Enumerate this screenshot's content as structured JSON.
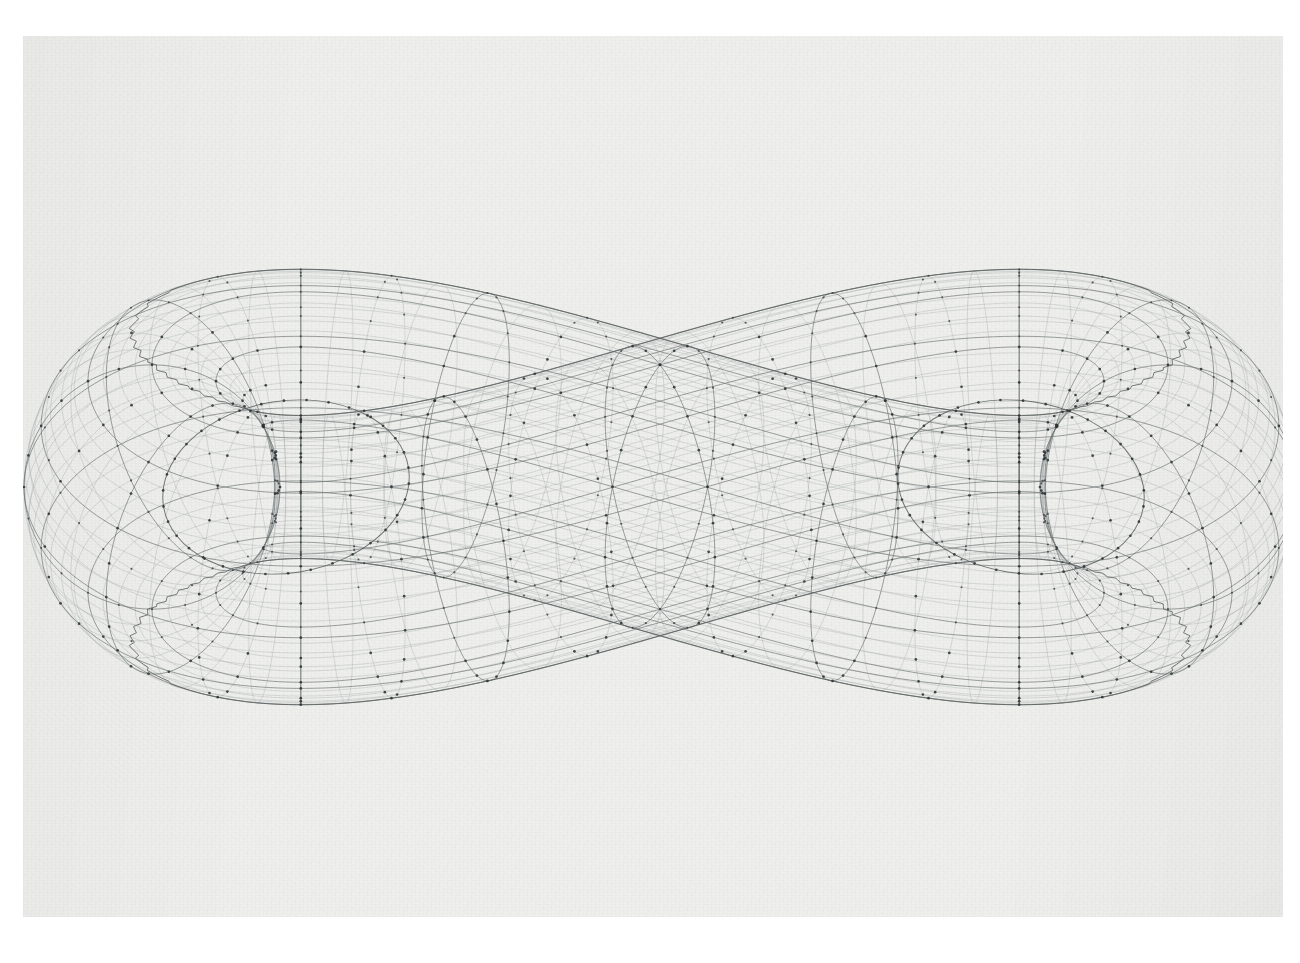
{
  "document": {
    "kind": "scanned-figure-page",
    "background_color": "#ffffff",
    "paper_color": "#eff0ee",
    "page_rect": {
      "x": 23,
      "y": 36,
      "width": 1260,
      "height": 881
    }
  },
  "figure": {
    "title": "",
    "caption": "",
    "ink_color": "#5d6262",
    "fine_line_color": "#9aa0a0",
    "rib_line_color": "#6e7474",
    "node_color": "#3d4242",
    "projection": "orthographic",
    "has_axes": false,
    "has_axis_labels": false,
    "has_legend": false,
    "has_tick_labels": false,
    "has_title_text": false
  },
  "chart_data": {
    "type": "line",
    "title": "",
    "subtitle": "",
    "xlabel": "",
    "ylabel": "",
    "legend": [],
    "annotations": [],
    "grid": true,
    "surface": {
      "name": "genus-2 double torus wireframe",
      "topology": "genus-2",
      "lobes": 2,
      "u_parameter": {
        "name": "ring angle",
        "range_deg": [
          0,
          360
        ],
        "major_divisions": 16,
        "fine_divisions": 64
      },
      "v_parameter": {
        "name": "tube angle",
        "range_deg": [
          0,
          360
        ],
        "major_divisions": 12,
        "fine_divisions": 48
      },
      "node_markers": true,
      "node_marker_radius_px": 1.35
    },
    "layout": {
      "plot_center": [
        660,
        487
      ],
      "lobe_centers": [
        [
          287,
          487
        ],
        [
          1020,
          487
        ]
      ],
      "lobe_ring_radius_x": 262,
      "lobe_ring_radius_y": 190,
      "tube_radius_x": 128,
      "tube_radius_y": 118,
      "vertical_squash": 0.62,
      "tilt_deg": 12,
      "hole_ellipses": [
        {
          "cx": 286,
          "cy": 487,
          "rx": 124,
          "ry": 86,
          "rot_deg": -9
        },
        {
          "cx": 1021,
          "cy": 487,
          "rx": 124,
          "ry": 86,
          "rot_deg": 9
        }
      ],
      "silhouette_extents": {
        "left_x": 92,
        "right_x": 1206,
        "top_y": 92,
        "bottom_y": 892
      }
    },
    "series": [
      {
        "name": "u-isolines (major ribs)",
        "count": 16,
        "style": "dotted-node",
        "values": []
      },
      {
        "name": "v-isolines (major ribs)",
        "count": 12,
        "style": "dotted-node",
        "values": []
      },
      {
        "name": "u-isolines (fine)",
        "count": 64,
        "style": "plain",
        "values": []
      },
      {
        "name": "v-isolines (fine)",
        "count": 48,
        "style": "plain",
        "values": []
      }
    ]
  }
}
